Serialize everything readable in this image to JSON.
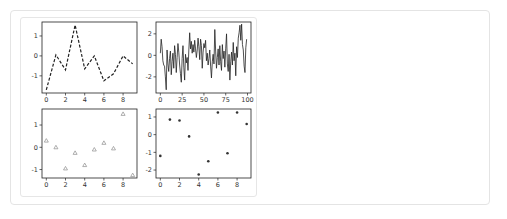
{
  "chart_data": [
    {
      "type": "line",
      "position": "top-left",
      "title": "",
      "xlabel": "",
      "ylabel": "",
      "line_style": "dashed",
      "color": "#222222",
      "x": [
        0,
        1,
        2,
        3,
        4,
        5,
        6,
        7,
        8,
        9
      ],
      "values": [
        -1.7,
        0.05,
        -0.7,
        1.55,
        -0.65,
        0.0,
        -1.25,
        -0.9,
        0.0,
        -0.4
      ],
      "xlim": [
        -0.45,
        9.45
      ],
      "ylim": [
        -1.86,
        1.7
      ],
      "xticks": [
        "0",
        "2",
        "4",
        "6",
        "8"
      ],
      "yticks": [
        "1",
        "0",
        "-1"
      ],
      "grid": false
    },
    {
      "type": "line",
      "position": "top-right",
      "title": "",
      "xlabel": "",
      "ylabel": "",
      "line_style": "solid",
      "color": "#222222",
      "x_range": [
        0,
        99
      ],
      "values": [
        0.2,
        1.5,
        0.8,
        -0.5,
        -0.9,
        -1.0,
        -2.0,
        -3.2,
        0.5,
        -0.8,
        -1.5,
        -0.3,
        0.4,
        -1.8,
        -0.6,
        0.2,
        -1.2,
        0.9,
        0.1,
        -1.6,
        -0.2,
        1.1,
        0.3,
        -0.9,
        -1.7,
        -2.5,
        -0.3,
        0.9,
        -1.1,
        -2.3,
        0.1,
        -0.7,
        -0.2,
        -1.4,
        0.5,
        2.1,
        0.6,
        1.3,
        0.2,
        1.0,
        0.3,
        1.4,
        0.6,
        -0.2,
        0.5,
        1.6,
        0.8,
        -0.4,
        1.5,
        0.9,
        -1.2,
        0.3,
        1.1,
        0.7,
        1.4,
        -0.5,
        0.2,
        -0.9,
        -0.3,
        0.5,
        -1.0,
        -2.1,
        -0.6,
        0.1,
        -0.8,
        2.4,
        0.4,
        -1.2,
        -0.2,
        0.6,
        -0.9,
        0.9,
        -0.6,
        -1.4,
        1.0,
        -0.3,
        0.4,
        -1.1,
        0.6,
        2.0,
        -0.8,
        -1.5,
        0.1,
        -2.3,
        -0.6,
        0.3,
        -0.9,
        1.2,
        -0.5,
        0.2,
        -1.9,
        0.8,
        -0.2,
        1.6,
        2.1,
        2.8,
        1.4,
        2.9,
        1.0,
        0.5,
        -1.0,
        -1.6,
        0.7,
        1.5
      ],
      "xlim": [
        -5,
        104
      ],
      "ylim": [
        -3.5,
        3.1
      ],
      "xticks": [
        "0",
        "25",
        "50",
        "75",
        "100"
      ],
      "yticks": [
        "2",
        "0",
        "-2"
      ],
      "grid": false
    },
    {
      "type": "scatter",
      "position": "bottom-left",
      "title": "",
      "xlabel": "",
      "ylabel": "",
      "marker": "triangle",
      "color": "#999999",
      "x": [
        0,
        1,
        2,
        3,
        4,
        5,
        6,
        7,
        8,
        9
      ],
      "values": [
        0.3,
        0.0,
        -0.95,
        -0.25,
        -0.8,
        -0.1,
        0.2,
        -0.05,
        1.5,
        -1.25
      ],
      "xlim": [
        -0.45,
        9.45
      ],
      "ylim": [
        -1.38,
        1.72
      ],
      "xticks": [
        "0",
        "2",
        "4",
        "6",
        "8"
      ],
      "yticks": [
        "1",
        "0",
        "-1"
      ],
      "grid": false
    },
    {
      "type": "scatter",
      "position": "bottom-right",
      "title": "",
      "xlabel": "",
      "ylabel": "",
      "marker": "dot",
      "color": "#333333",
      "x": [
        0,
        1,
        2,
        3,
        4,
        5,
        6,
        7,
        8,
        9
      ],
      "values": [
        -1.2,
        0.85,
        0.8,
        -0.1,
        -2.25,
        -1.5,
        1.25,
        -1.05,
        1.25,
        0.6
      ],
      "xlim": [
        -0.45,
        9.45
      ],
      "ylim": [
        -2.45,
        1.45
      ],
      "xticks": [
        "0",
        "2",
        "4",
        "6",
        "8"
      ],
      "yticks": [
        "1",
        "0",
        "-1",
        "-2"
      ],
      "grid": false
    }
  ]
}
